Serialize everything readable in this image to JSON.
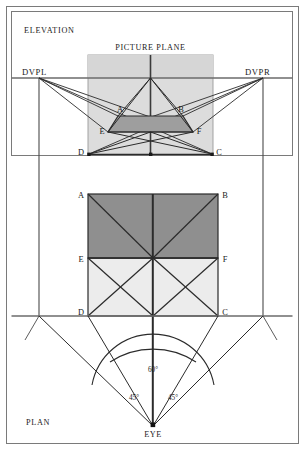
{
  "figure": {
    "title_elevation": "ELEVATION",
    "title_plan": "PLAN",
    "picture_plane_label": "PICTURE PLANE",
    "dvpl_label": "DVPL",
    "dvpr_label": "DVPR",
    "eye_label": "EYE",
    "angle_cone_label": "60°",
    "angle_left_label": "45°",
    "angle_right_label": "45°",
    "vertex_labels": {
      "a": "A",
      "b": "B",
      "c": "C",
      "d": "D",
      "e": "E",
      "f": "F"
    },
    "elevation_vertices": {
      "a": "A",
      "b": "B",
      "c": "C",
      "d": "D",
      "e": "E",
      "f": "F"
    },
    "plan_vertices": {
      "a": "A",
      "b": "B",
      "c": "C",
      "d": "D",
      "e": "E",
      "f": "F"
    },
    "colors": {
      "line": "#2b2b2b",
      "thin_line": "#6b6b6b",
      "fill_light": "#ececec",
      "fill_mid": "#cfcfcf",
      "fill_dark": "#a3a3a3",
      "border": "#7a7a7a",
      "background": "#ffffff"
    }
  }
}
